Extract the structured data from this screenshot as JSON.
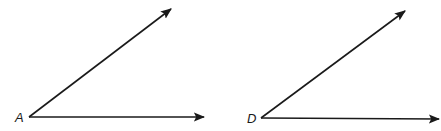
{
  "diagram": {
    "type": "geometry-angles",
    "angles": [
      {
        "vertex_label": "A",
        "vertex": [
          29,
          117
        ],
        "ray1_end": [
          205,
          117
        ],
        "ray2_end": [
          172,
          8
        ]
      },
      {
        "vertex_label": "D",
        "vertex": [
          261,
          118
        ],
        "ray1_end": [
          440,
          119
        ],
        "ray2_end": [
          406,
          10
        ]
      }
    ],
    "colors": {
      "stroke": "#1a1a1a",
      "background": "#ffffff"
    }
  }
}
